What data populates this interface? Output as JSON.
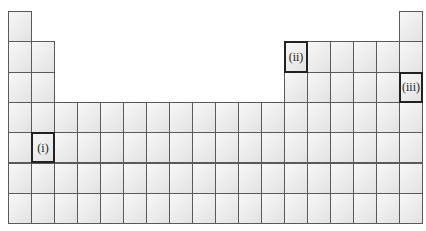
{
  "grid": {
    "origin_x": 8,
    "origin_y": 11,
    "cell_width": 23,
    "cell_height": 30.3,
    "columns": 18,
    "rows": 7
  },
  "layout_rows": [
    {
      "row": 1,
      "columns": [
        1,
        18
      ]
    },
    {
      "row": 2,
      "columns": [
        1,
        2,
        13,
        14,
        15,
        16,
        17,
        18
      ]
    },
    {
      "row": 3,
      "columns": [
        1,
        2,
        13,
        14,
        15,
        16,
        17,
        18
      ]
    },
    {
      "row": 4,
      "columns": [
        1,
        2,
        3,
        4,
        5,
        6,
        7,
        8,
        9,
        10,
        11,
        12,
        13,
        14,
        15,
        16,
        17,
        18
      ]
    },
    {
      "row": 5,
      "columns": [
        1,
        2,
        3,
        4,
        5,
        6,
        7,
        8,
        9,
        10,
        11,
        12,
        13,
        14,
        15,
        16,
        17,
        18
      ]
    },
    {
      "row": 6,
      "columns": [
        1,
        2,
        3,
        4,
        5,
        6,
        7,
        8,
        9,
        10,
        11,
        12,
        13,
        14,
        15,
        16,
        17,
        18
      ]
    },
    {
      "row": 7,
      "columns": [
        1,
        2,
        3,
        4,
        5,
        6,
        7,
        8,
        9,
        10,
        11,
        12,
        13,
        14,
        15,
        16,
        17,
        18
      ]
    }
  ],
  "marked_cells": [
    {
      "label": "(i)",
      "row": 5,
      "column": 2
    },
    {
      "label": "(ii)",
      "row": 2,
      "column": 13
    },
    {
      "label": "(iii)",
      "row": 3,
      "column": 18
    }
  ]
}
